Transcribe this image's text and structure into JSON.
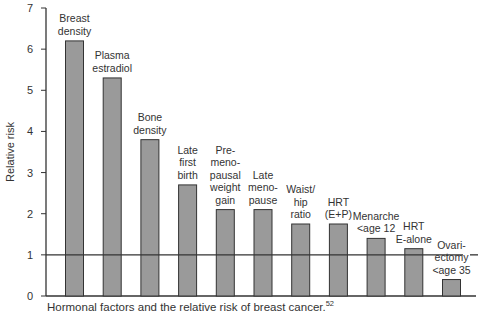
{
  "chart_data": {
    "type": "bar",
    "title": "",
    "xlabel": "",
    "ylabel": "Relative risk",
    "ylim": [
      0,
      7
    ],
    "yticks": [
      0,
      1,
      2,
      3,
      4,
      5,
      6,
      7
    ],
    "grid": false,
    "reference_line": 1,
    "categories": [
      "Breast density",
      "Plasma estradiol",
      "Bone density",
      "Late first birth",
      "Pre-menopausal weight gain",
      "Late menopause",
      "Waist/hip ratio",
      "HRT (E+P)",
      "Menarche <age 12",
      "HRT E-alone",
      "Ovariectomy <age 35"
    ],
    "label_lines": [
      [
        "Breast",
        "density"
      ],
      [
        "Plasma",
        "estradiol"
      ],
      [
        "Bone",
        "density"
      ],
      [
        "Late",
        "first",
        "birth"
      ],
      [
        "Pre-",
        "meno-",
        "pausal",
        "weight",
        "gain"
      ],
      [
        "Late",
        "meno-",
        "pause"
      ],
      [
        "Waist/",
        "hip",
        "ratio"
      ],
      [
        "HRT",
        "(E+P)"
      ],
      [
        "Menarche",
        "<age 12"
      ],
      [
        "HRT",
        "E-alone"
      ],
      [
        "Ovari-",
        "ectomy",
        "<age 35"
      ]
    ],
    "values": [
      6.2,
      5.3,
      3.8,
      2.7,
      2.1,
      2.1,
      1.75,
      1.75,
      1.4,
      1.15,
      0.4
    ],
    "colors": {
      "bar": "#9a9a9a",
      "bar_edge": "#333333",
      "axis": "#333333"
    }
  },
  "caption": {
    "text": "Hormonal factors and the relative risk of breast cancer.",
    "ref": "52"
  }
}
